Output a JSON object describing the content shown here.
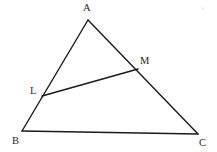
{
  "figure": {
    "background_color": "#ffffff",
    "stroke_color": "#1a1a1a",
    "label_color": "#1f1f1f",
    "width": 217,
    "height": 152,
    "points": {
      "A": {
        "label": "A",
        "x": 88,
        "y": 20,
        "label_x": 83,
        "label_y": 2
      },
      "B": {
        "label": "B",
        "x": 22,
        "y": 131,
        "label_x": 12,
        "label_y": 135
      },
      "C": {
        "label": "C",
        "x": 198,
        "y": 134,
        "label_x": 199,
        "label_y": 137
      },
      "L": {
        "label": "L",
        "x": 42,
        "y": 96,
        "label_x": 30,
        "label_y": 85
      },
      "M": {
        "label": "M",
        "x": 138,
        "y": 69,
        "label_x": 140,
        "label_y": 55
      }
    },
    "segments": [
      {
        "name": "side-AB",
        "from": "A",
        "to": "B",
        "path": "M 88 20 L 22 131"
      },
      {
        "name": "side-AC",
        "from": "A",
        "to": "C",
        "path": "M 88 20 L 198 134"
      },
      {
        "name": "side-BC",
        "from": "B",
        "to": "C",
        "path": "M 22 131 L 198 134"
      },
      {
        "name": "segment-LM",
        "from": "L",
        "to": "M",
        "path": "M 42 96 L 138 69"
      }
    ],
    "artifact": {
      "name": "scan-speck",
      "x": 201,
      "y": 7,
      "size": 3
    }
  }
}
